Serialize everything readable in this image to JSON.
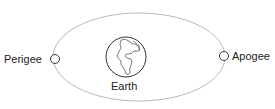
{
  "diagram": {
    "labels": {
      "perigee": "Perigee",
      "apogee": "Apogee",
      "earth": "Earth"
    },
    "colors": {
      "orbit": "#b5b5b5",
      "stroke": "#333333",
      "text": "#222222"
    }
  }
}
